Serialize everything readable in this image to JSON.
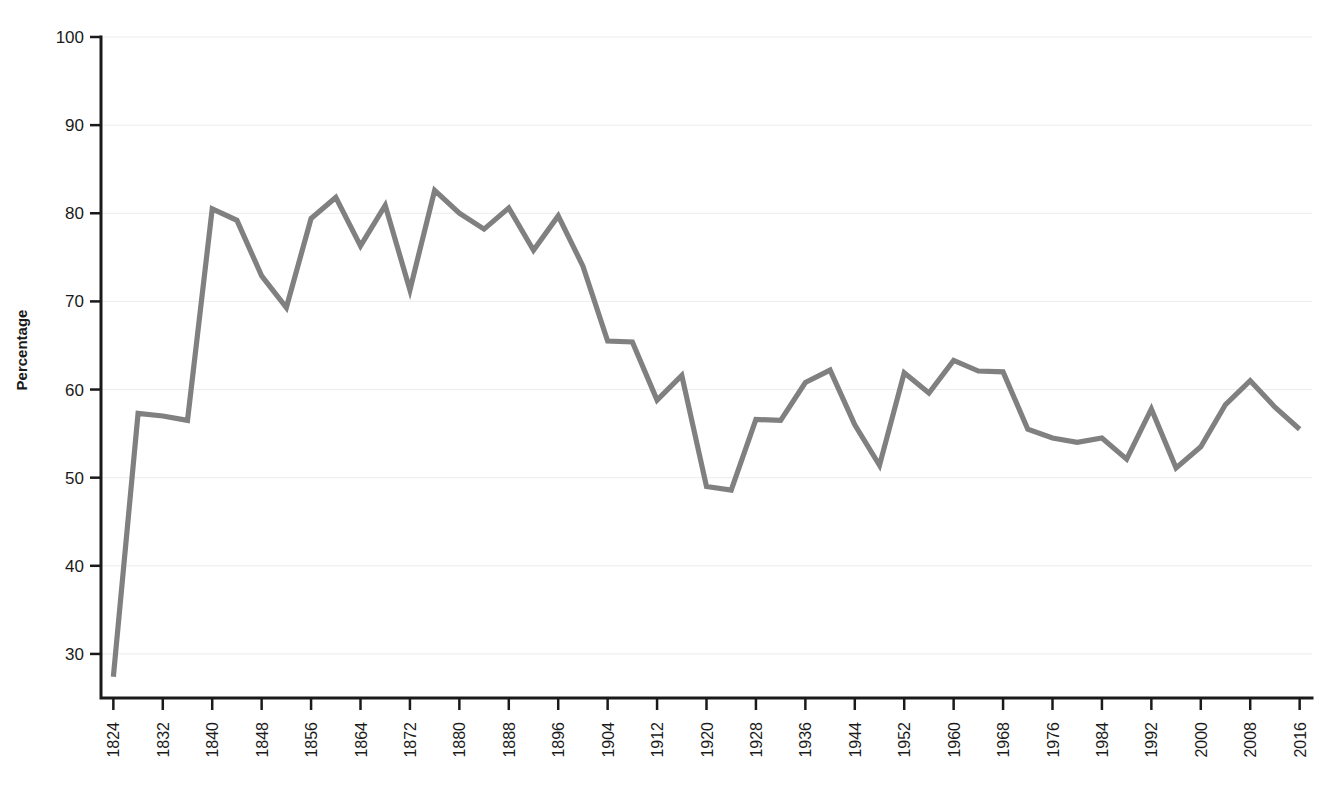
{
  "chart_data": {
    "type": "line",
    "title": "",
    "subtitle": "",
    "xlabel": "",
    "ylabel": "Percentage",
    "xlim": [
      1822,
      2018
    ],
    "ylim": [
      25,
      100
    ],
    "ytick_values": [
      30,
      40,
      50,
      60,
      70,
      80,
      90,
      100
    ],
    "ytick_labels": [
      "30",
      "40",
      "50",
      "60",
      "70",
      "80",
      "90",
      "100"
    ],
    "xtick_labels": [
      "1824",
      "1832",
      "1840",
      "1848",
      "1856",
      "1864",
      "1872",
      "1880",
      "1888",
      "1896",
      "1904",
      "1912",
      "1920",
      "1928",
      "1936",
      "1944",
      "1952",
      "1960",
      "1968",
      "1976",
      "1984",
      "1992",
      "2000",
      "2008",
      "2016"
    ],
    "xtick_values": [
      1824,
      1832,
      1840,
      1848,
      1856,
      1864,
      1872,
      1880,
      1888,
      1896,
      1904,
      1912,
      1920,
      1928,
      1936,
      1944,
      1952,
      1960,
      1968,
      1976,
      1984,
      1992,
      2000,
      2008,
      2016
    ],
    "grid": "horizontal",
    "legend": "none",
    "line_color": "#808080",
    "axis_color": "#1a1a1a",
    "grid_color": "#ececec",
    "x": [
      1824,
      1828,
      1832,
      1836,
      1840,
      1844,
      1848,
      1852,
      1856,
      1860,
      1864,
      1868,
      1872,
      1876,
      1880,
      1884,
      1888,
      1892,
      1896,
      1900,
      1904,
      1908,
      1912,
      1916,
      1920,
      1924,
      1928,
      1932,
      1936,
      1940,
      1944,
      1948,
      1952,
      1956,
      1960,
      1964,
      1968,
      1972,
      1976,
      1980,
      1984,
      1988,
      1992,
      1996,
      2000,
      2004,
      2008,
      2012,
      2016
    ],
    "series": [
      {
        "name": "Voter turnout",
        "values": [
          27.4,
          57.3,
          57.0,
          56.5,
          80.5,
          79.2,
          72.9,
          69.3,
          79.4,
          81.8,
          76.3,
          80.9,
          71.3,
          82.6,
          80.0,
          78.2,
          80.6,
          75.8,
          79.7,
          74.0,
          65.5,
          65.4,
          58.8,
          61.6,
          49.0,
          48.6,
          56.6,
          56.5,
          60.8,
          62.2,
          56.0,
          51.4,
          61.9,
          59.6,
          63.3,
          62.1,
          62.0,
          55.5,
          54.5,
          54.0,
          54.5,
          52.1,
          57.8,
          51.1,
          53.5,
          58.3,
          61.0,
          58.0,
          55.5
        ]
      }
    ]
  }
}
